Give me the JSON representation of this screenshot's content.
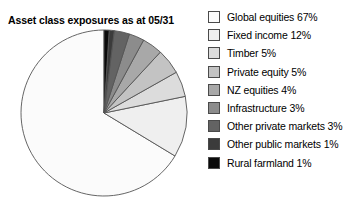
{
  "chart_data": {
    "type": "pie",
    "title": "Asset class exposures as at 05/31",
    "xlabel": "",
    "ylabel": "",
    "legend_position": "right",
    "grid": false,
    "start_angle_deg": 90,
    "direction": "counterclockwise",
    "stroke_color": "#555555",
    "categories": [
      "Global equities",
      "Fixed income",
      "Timber",
      "Private equity",
      "NZ equities",
      "Infrastructure",
      "Other private markets",
      "Other public markets",
      "Rural farmland"
    ],
    "values": [
      67,
      12,
      5,
      5,
      4,
      3,
      3,
      1,
      1
    ],
    "value_suffix": "%",
    "colors": [
      "#fbfbfb",
      "#efefef",
      "#dcdcdc",
      "#c3c3c3",
      "#a8a8a8",
      "#8c8c8c",
      "#636363",
      "#3b3b3b",
      "#0a0a0a"
    ],
    "slices": [
      {
        "label": "Global equities",
        "value": 67,
        "color": "#fbfbfb",
        "legend_text": "Global equities 67%"
      },
      {
        "label": "Fixed income",
        "value": 12,
        "color": "#efefef",
        "legend_text": "Fixed income 12%"
      },
      {
        "label": "Timber",
        "value": 5,
        "color": "#dcdcdc",
        "legend_text": "Timber 5%"
      },
      {
        "label": "Private equity",
        "value": 5,
        "color": "#c3c3c3",
        "legend_text": "Private equity 5%"
      },
      {
        "label": "NZ equities",
        "value": 4,
        "color": "#a8a8a8",
        "legend_text": "NZ equities 4%"
      },
      {
        "label": "Infrastructure",
        "value": 3,
        "color": "#8c8c8c",
        "legend_text": "Infrastructure 3%"
      },
      {
        "label": "Other private markets",
        "value": 3,
        "color": "#636363",
        "legend_text": "Other private markets 3%"
      },
      {
        "label": "Other public markets",
        "value": 1,
        "color": "#3b3b3b",
        "legend_text": "Other public markets 1%"
      },
      {
        "label": "Rural farmland",
        "value": 1,
        "color": "#0a0a0a",
        "legend_text": "Rural farmland 1%"
      }
    ]
  }
}
